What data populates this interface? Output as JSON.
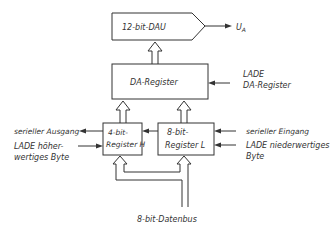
{
  "diagram": {
    "dac": {
      "label": "12-bit-DAU",
      "output_label": "U",
      "output_subscript": "A"
    },
    "da_register": {
      "label": "DA-Register",
      "load_label_line1": "LADE",
      "load_label_line2": "DA-Register"
    },
    "register_h": {
      "line1": "4-bit-",
      "line2": "Register H"
    },
    "register_l": {
      "line1": "8-bit-",
      "line2": "Register L"
    },
    "serial_output": "serieller Ausgang",
    "serial_input": "serieller Eingang",
    "load_high_line1": "LADE höher-",
    "load_high_line2": "wertiges Byte",
    "load_low_line1": "LADE niederwertiges",
    "load_low_line2": "Byte",
    "databus": "8-bit-Datenbus"
  }
}
